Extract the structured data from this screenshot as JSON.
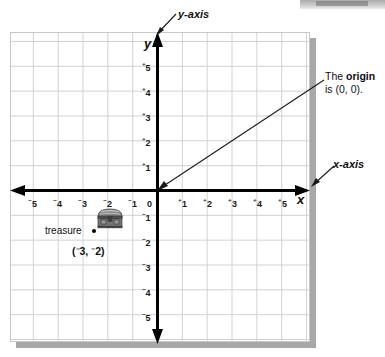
{
  "figure": {
    "type": "coordinate-plane-diagram",
    "grid": {
      "x_min": -6,
      "x_max": 6,
      "y_min": -6,
      "y_max": 6,
      "cell_size_px": 25,
      "grid_color": "#d2d2d2",
      "axis_color": "#000000",
      "background": "#ffffff"
    },
    "axis_letters": {
      "x": "x",
      "y": "y"
    },
    "x_ticks": [
      {
        "sign": "⁻",
        "value": "5"
      },
      {
        "sign": "⁻",
        "value": "4"
      },
      {
        "sign": "⁻",
        "value": "3"
      },
      {
        "sign": "⁻",
        "value": "2"
      },
      {
        "sign": "⁻",
        "value": "1"
      },
      {
        "sign": "",
        "value": "0"
      },
      {
        "sign": "⁺",
        "value": "1"
      },
      {
        "sign": "⁺",
        "value": "2"
      },
      {
        "sign": "⁺",
        "value": "3"
      },
      {
        "sign": "⁺",
        "value": "4"
      },
      {
        "sign": "⁺",
        "value": "5"
      }
    ],
    "y_ticks": [
      {
        "sign": "⁺",
        "value": "5"
      },
      {
        "sign": "⁺",
        "value": "4"
      },
      {
        "sign": "⁺",
        "value": "3"
      },
      {
        "sign": "⁺",
        "value": "2"
      },
      {
        "sign": "⁺",
        "value": "1"
      },
      {
        "sign": "⁻",
        "value": "1"
      },
      {
        "sign": "⁻",
        "value": "2"
      },
      {
        "sign": "⁻",
        "value": "3"
      },
      {
        "sign": "⁻",
        "value": "4"
      },
      {
        "sign": "⁻",
        "value": "5"
      }
    ],
    "callouts": {
      "y_axis_label": "y-axis",
      "x_axis_label": "x-axis",
      "origin_line1_prefix": "The ",
      "origin_line1_bold": "origin",
      "origin_line2": "is (0, 0)."
    },
    "plotted_point": {
      "label": "treasure",
      "coords_open": "(",
      "coords_x_sign": "⁻",
      "coords_x": "3",
      "coords_sep": ", ",
      "coords_y_sign": "⁻",
      "coords_y": "2",
      "coords_close": ")",
      "x": -3,
      "y": -2,
      "icon": "treasure-chest-icon"
    }
  },
  "chart_data": {
    "type": "scatter",
    "title": "",
    "xlabel": "x-axis",
    "ylabel": "y-axis",
    "xlim": [
      -6,
      6
    ],
    "ylim": [
      -6,
      6
    ],
    "xticks": [
      -5,
      -4,
      -3,
      -2,
      -1,
      0,
      1,
      2,
      3,
      4,
      5
    ],
    "yticks": [
      -5,
      -4,
      -3,
      -2,
      -1,
      1,
      2,
      3,
      4,
      5
    ],
    "grid": true,
    "legend": false,
    "series": [
      {
        "name": "treasure",
        "points": [
          {
            "x": -3,
            "y": -2,
            "label": "treasure (⁻3, ⁻2)"
          }
        ]
      }
    ],
    "annotations": [
      {
        "text": "y-axis",
        "points_to": [
          0,
          6
        ]
      },
      {
        "text": "x-axis",
        "points_to": [
          6,
          0
        ]
      },
      {
        "text": "The origin is (0, 0).",
        "points_to": [
          0,
          0
        ]
      }
    ]
  }
}
